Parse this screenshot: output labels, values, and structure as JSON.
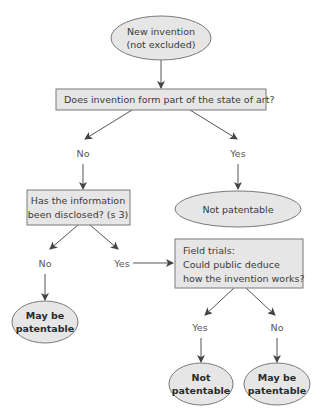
{
  "diagram": {
    "type": "flowchart",
    "title": "",
    "colors": {
      "node_fill": "#e6e6e6",
      "node_border": "#7a7a7a",
      "edge": "#555555",
      "text": "#3a3a3a"
    },
    "nodes": {
      "start": {
        "shape": "ellipse",
        "lines": [
          "New invention",
          "(not excluded)"
        ]
      },
      "state_of_art": {
        "shape": "rect",
        "lines": [
          "Does invention form part of the state of art?"
        ]
      },
      "not_patentable_1": {
        "shape": "ellipse",
        "lines": [
          "Not patentable"
        ]
      },
      "disclosed": {
        "shape": "rect",
        "lines": [
          "Has the information",
          "been disclosed? (s 3)"
        ]
      },
      "field_trials": {
        "shape": "rect",
        "lines": [
          "Field trials:",
          "Could public deduce",
          "how the invention works?"
        ]
      },
      "may_be_patentable_1": {
        "shape": "ellipse",
        "bold": true,
        "lines": [
          "May be",
          "patentable"
        ]
      },
      "not_patentable_2": {
        "shape": "ellipse",
        "bold": true,
        "lines": [
          "Not",
          "patentable"
        ]
      },
      "may_be_patentable_2": {
        "shape": "ellipse",
        "bold": true,
        "lines": [
          "May be",
          "patentable"
        ]
      }
    },
    "edges": [
      {
        "from": "start",
        "to": "state_of_art",
        "label": ""
      },
      {
        "from": "state_of_art",
        "to": "disclosed",
        "label": "No"
      },
      {
        "from": "state_of_art",
        "to": "not_patentable_1",
        "label": "Yes"
      },
      {
        "from": "disclosed",
        "to": "may_be_patentable_1",
        "label": "No"
      },
      {
        "from": "disclosed",
        "to": "field_trials",
        "label": "Yes"
      },
      {
        "from": "field_trials",
        "to": "not_patentable_2",
        "label": "Yes"
      },
      {
        "from": "field_trials",
        "to": "may_be_patentable_2",
        "label": "No"
      }
    ],
    "edge_labels": {
      "sota_no": "No",
      "sota_yes": "Yes",
      "disclosed_no": "No",
      "disclosed_yes": "Yes",
      "trials_yes": "Yes",
      "trials_no": "No"
    }
  }
}
